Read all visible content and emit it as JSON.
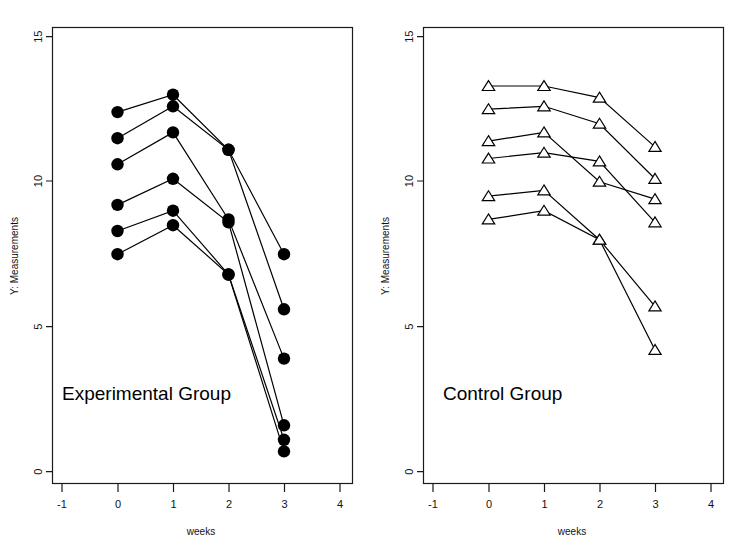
{
  "figure": {
    "background": "#ffffff",
    "foreground": "#000000",
    "panel_count": 2
  },
  "chart_data": [
    {
      "type": "line",
      "panel": "left",
      "title": "Experimental Group",
      "annotation": "Experimental Group",
      "xlabel": "weeks",
      "ylabel": "Y: Measurements",
      "marker": "filled-circle",
      "grid": false,
      "legend": "none",
      "x": [
        0,
        1,
        2,
        3
      ],
      "xlim": [
        -1.35,
        4.35
      ],
      "ylim": [
        -1.1,
        15.7
      ],
      "xticks": [
        -1,
        0,
        1,
        2,
        3,
        4
      ],
      "xticklabels": [
        "-1",
        "0",
        "1",
        "2",
        "3",
        "4"
      ],
      "yticks": [
        0,
        5,
        10,
        15
      ],
      "yticklabels": [
        "0",
        "5",
        "10",
        "15"
      ],
      "series": [
        {
          "name": "subject-1",
          "values": [
            12.4,
            13.0,
            11.1,
            7.5
          ]
        },
        {
          "name": "subject-2",
          "values": [
            11.5,
            12.6,
            11.1,
            5.6
          ]
        },
        {
          "name": "subject-3",
          "values": [
            10.6,
            11.7,
            8.7,
            3.9
          ]
        },
        {
          "name": "subject-4",
          "values": [
            9.2,
            10.1,
            8.6,
            1.6
          ]
        },
        {
          "name": "subject-5",
          "values": [
            8.3,
            9.0,
            6.8,
            1.1
          ]
        },
        {
          "name": "subject-6",
          "values": [
            7.5,
            8.5,
            6.8,
            0.7
          ]
        }
      ]
    },
    {
      "type": "line",
      "panel": "right",
      "title": "Control Group",
      "annotation": "Control Group",
      "xlabel": "weeks",
      "ylabel": "Y: Measurements",
      "marker": "open-triangle",
      "grid": false,
      "legend": "none",
      "x": [
        0,
        1,
        2,
        3
      ],
      "xlim": [
        -1.35,
        4.35
      ],
      "ylim": [
        -1.1,
        15.7
      ],
      "xticks": [
        -1,
        0,
        1,
        2,
        3,
        4
      ],
      "xticklabels": [
        "-1",
        "0",
        "1",
        "2",
        "3",
        "4"
      ],
      "yticks": [
        0,
        5,
        10,
        15
      ],
      "yticklabels": [
        "0",
        "5",
        "10",
        "15"
      ],
      "series": [
        {
          "name": "subject-1",
          "values": [
            13.3,
            13.3,
            12.9,
            11.2
          ]
        },
        {
          "name": "subject-2",
          "values": [
            12.5,
            12.6,
            12.0,
            10.1
          ]
        },
        {
          "name": "subject-3",
          "values": [
            11.4,
            11.7,
            10.0,
            9.4
          ]
        },
        {
          "name": "subject-4",
          "values": [
            10.8,
            11.0,
            10.7,
            8.6
          ]
        },
        {
          "name": "subject-5",
          "values": [
            9.5,
            9.7,
            8.0,
            5.7
          ]
        },
        {
          "name": "subject-6",
          "values": [
            8.7,
            9.0,
            8.0,
            4.2
          ]
        }
      ]
    }
  ]
}
